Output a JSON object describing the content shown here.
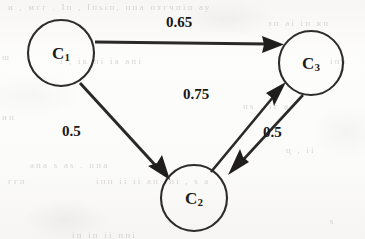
{
  "figure": {
    "kind": "weighted-directed-graph",
    "medium": "scanned-document",
    "background_color": "#fbfbfa",
    "ink_color": "#2b2927"
  },
  "nodes": [
    {
      "id": "C1",
      "base": "C",
      "subscript": "1",
      "cx": 61,
      "cy": 53,
      "r": 33
    },
    {
      "id": "C3",
      "base": "C",
      "subscript": "3",
      "cx": 311,
      "cy": 63,
      "r": 32
    },
    {
      "id": "C2",
      "base": "C",
      "subscript": "2",
      "cx": 194,
      "cy": 198,
      "r": 33
    }
  ],
  "edges": [
    {
      "id": "e1",
      "from": "C1",
      "to": "C3",
      "weight": "0.65",
      "label_x": 166,
      "label_y": 14
    },
    {
      "id": "e2",
      "from": "C1",
      "to": "C2",
      "weight": "0.5",
      "label_x": 62,
      "label_y": 123
    },
    {
      "id": "e3",
      "from": "C2",
      "to": "C3",
      "weight": "0.75",
      "label_x": 183,
      "label_y": 86
    },
    {
      "id": "e4",
      "from": "C3",
      "to": "C2",
      "weight": "0.5",
      "label_x": 263,
      "label_y": 124
    }
  ],
  "ghost_text": [
    {
      "id": "g1",
      "text": "и  ,  мгг     . Іп  ,  Іпѕіп,   ппа   птгчпіп   ау",
      "x": 8,
      "y": 2,
      "size": 9
    },
    {
      "id": "g2",
      "text": "зп      аі       іп         кп",
      "x": 268,
      "y": 18,
      "size": 9
    },
    {
      "id": "g3",
      "text": "ш",
      "x": 2,
      "y": 52,
      "size": 9
    },
    {
      "id": "g4",
      "text": "і   ,      ік      пі       іа     апі",
      "x": 60,
      "y": 56,
      "size": 9
    },
    {
      "id": "g5",
      "text": "іпа",
      "x": 330,
      "y": 56,
      "size": 9
    },
    {
      "id": "g6",
      "text": "ип",
      "x": 2,
      "y": 112,
      "size": 9
    },
    {
      "id": "g7",
      "text": "пѕ   ,   іг    а",
      "x": 243,
      "y": 101,
      "size": 9
    },
    {
      "id": "g8",
      "text": "ц  ,   іі",
      "x": 286,
      "y": 145,
      "size": 9
    },
    {
      "id": "g9",
      "text": "апа   ѕ     аѕ     . ппа",
      "x": 30,
      "y": 160,
      "size": 9
    },
    {
      "id": "g10",
      "text": "іпп      іі      іі     ап   іпі   ,  ѕ     а",
      "x": 96,
      "y": 176,
      "size": 9
    },
    {
      "id": "g11",
      "text": "ггп",
      "x": 8,
      "y": 176,
      "size": 9
    },
    {
      "id": "g12",
      "text": "іп        іп         іі       ппі",
      "x": 72,
      "y": 230,
      "size": 9
    },
    {
      "id": "g13",
      "text": "ѕ",
      "x": 330,
      "y": 216,
      "size": 9
    }
  ]
}
